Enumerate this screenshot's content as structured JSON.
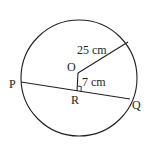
{
  "diagram": {
    "type": "circle-chord-geometry",
    "labels": {
      "center": "O",
      "chord_start": "P",
      "chord_end": "Q",
      "foot": "R",
      "radius_length": "25 cm",
      "distance_length": "7 cm"
    },
    "colors": {
      "stroke": "#231f20",
      "background": "#ffffff"
    }
  }
}
